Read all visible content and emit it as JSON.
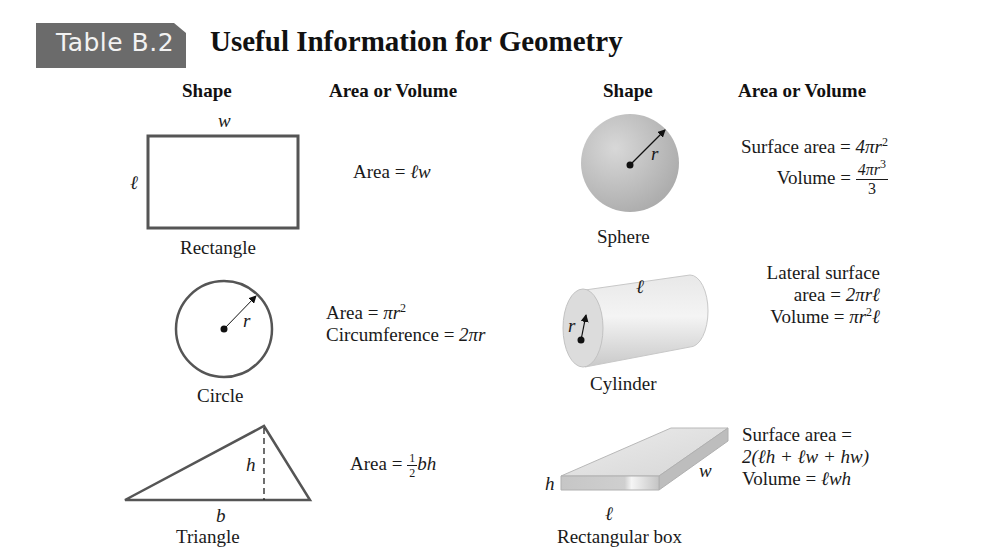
{
  "header": {
    "badge": "Table B.2",
    "title": "Useful Information for Geometry"
  },
  "columns": {
    "left_shape": "Shape",
    "left_formula": "Area or Volume",
    "right_shape": "Shape",
    "right_formula": "Area or Volume"
  },
  "shapes": {
    "rectangle": {
      "name": "Rectangle",
      "vars": {
        "width": "w",
        "length": "ℓ"
      },
      "formula": {
        "prefix": "Area = ",
        "expr": "ℓw"
      }
    },
    "circle": {
      "name": "Circle",
      "vars": {
        "radius": "r"
      },
      "formula": {
        "area_prefix": "Area = ",
        "area_expr": "πr",
        "area_exp": "2",
        "circ_prefix": "Circumference = ",
        "circ_expr": "2πr"
      }
    },
    "triangle": {
      "name": "Triangle",
      "vars": {
        "height": "h",
        "base": "b"
      },
      "formula": {
        "prefix": "Area = ",
        "frac_num": "1",
        "frac_den": "2",
        "expr": "bh"
      }
    },
    "sphere": {
      "name": "Sphere",
      "vars": {
        "radius": "r"
      },
      "formula": {
        "surface_prefix": "Surface area = ",
        "surface_expr": "4πr",
        "surface_exp": "2",
        "volume_prefix": "Volume = ",
        "volume_num": "4πr",
        "volume_num_exp": "3",
        "volume_den": "3"
      }
    },
    "cylinder": {
      "name": "Cylinder",
      "vars": {
        "length": "ℓ",
        "radius": "r"
      },
      "formula": {
        "lateral_line1": "Lateral surface",
        "lateral_prefix": "area = ",
        "lateral_expr": "2πrℓ",
        "volume_prefix": "Volume = ",
        "volume_expr1": "πr",
        "volume_exp": "2",
        "volume_expr2": "ℓ"
      }
    },
    "box": {
      "name": "Rectangular box",
      "vars": {
        "height": "h",
        "width": "w",
        "length": "ℓ"
      },
      "formula": {
        "surface_line1": "Surface area =",
        "surface_line2": "2(ℓh + ℓw + hw)",
        "volume_prefix": "Volume = ",
        "volume_expr": "ℓwh"
      }
    }
  },
  "colors": {
    "badge_bg": "#6b6b6b",
    "badge_text": "#f2f2f2",
    "outline": "#555555",
    "sphere_fill": "#bdbdbd"
  }
}
